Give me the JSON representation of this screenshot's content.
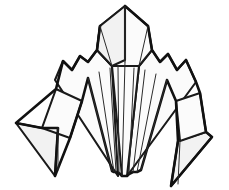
{
  "canvas": {
    "width": 229,
    "height": 190,
    "background_color": "#ffffff",
    "title": "origami-folded-paper-figure"
  },
  "style": {
    "outline_color": "#111111",
    "crease_color": "#2b2b2b",
    "face_fill_light": "#fbfbfb",
    "face_fill_shade": "#f2f2f2",
    "outline_width": 2.6,
    "face_width": 2.1,
    "crease_width": 1.0
  },
  "shapes": {
    "head": {
      "name": "hexagonal-head-panel",
      "points": "125,6 148,26 152,50 139,66 112,66 97,50 100,26"
    },
    "head_left_facet": {
      "name": "head-left-facet",
      "points": "125,6 100,26 97,50 112,66 125,60"
    },
    "body_left_wing": {
      "name": "body-left-wing-panel",
      "points": "112,66 97,50 88,62 80,56 72,70 63,61 55,80 118,176"
    },
    "body_right_wing": {
      "name": "body-right-wing-panel",
      "points": "139,66 152,50 160,62 168,54 177,70 186,60 196,82 127,176"
    },
    "body_center": {
      "name": "body-center-panel",
      "points": "112,66 125,62 139,66 127,176 122,176"
    },
    "left_flap": {
      "name": "left-folded-flap",
      "points": "56,89 82,101 70,138 42,128"
    },
    "left_leg_tip": {
      "name": "left-leg-tip",
      "points": "42,128 16,123 55,176 58,128"
    },
    "right_flap": {
      "name": "right-folded-flap",
      "points": "176,101 200,93 206,132 180,141"
    },
    "right_leg_tip": {
      "name": "right-leg-tip",
      "points": "206,132 212,137 171,186 178,141"
    }
  },
  "creases": {
    "fan_lines": [
      "125,62 122,176",
      "118,66 119,173",
      "110,68 116,172",
      "99,72 114,172",
      "88,78 112,171",
      "134,68 129,174",
      "145,70 133,172",
      "156,74 137,172",
      "167,80 141,170"
    ],
    "head_lines": [
      "125,6 125,62",
      "100,26 112,66",
      "148,26 139,66"
    ],
    "flap_lines": [
      "58,128 58,170",
      "180,141 178,184"
    ]
  },
  "outlines": {
    "silhouette": "125,6 148,26 152,50 160,62 168,54 177,70 186,60 196,82 200,93 206,132 212,137 171,186 178,141 176,101 167,80 141,170 137,172 133,172 129,174 127,176 122,176 119,173 116,172 114,172 112,171 88,78 82,101 70,138 55,176 58,128 42,128 16,123 56,89 63,61 72,70 80,56 88,62 97,50 100,26"
  },
  "labels": {
    "figure_name": "folded-paper-origami-figure"
  }
}
